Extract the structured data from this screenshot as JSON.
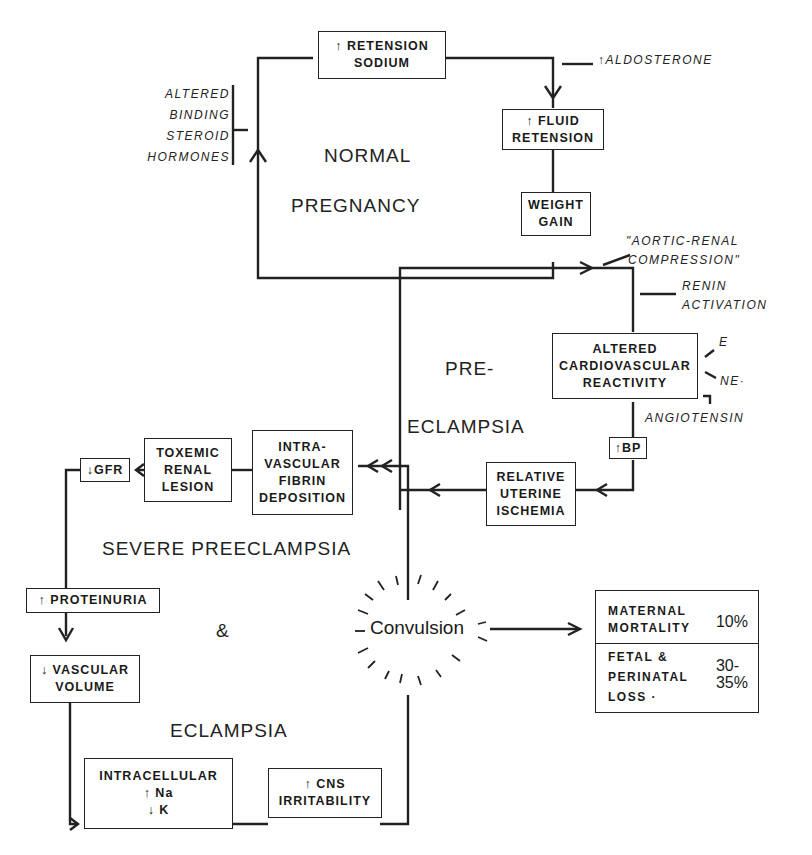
{
  "regions": {
    "normal_pregnancy": [
      "NORMAL",
      "PREGNANCY"
    ],
    "pre_eclampsia": [
      "PRE-",
      "ECLAMPSIA"
    ],
    "severe": [
      "SEVERE PREECLAMPSIA",
      "&",
      "ECLAMPSIA"
    ]
  },
  "boxes": {
    "retension_sodium": [
      "↑ RETENSION",
      "SODIUM"
    ],
    "fluid_retension": [
      "↑ FLUID",
      "RETENSION"
    ],
    "weight_gain": [
      "WEIGHT",
      "GAIN"
    ],
    "altered_cv": [
      "ALTERED",
      "CARDIOVASCULAR",
      "REACTIVITY"
    ],
    "bp": "↑BP",
    "uterine_ischemia": [
      "RELATIVE",
      "UTERINE",
      "ISCHEMIA"
    ],
    "fibrin": [
      "INTRA-",
      "VASCULAR",
      "FIBRIN",
      "DEPOSITION"
    ],
    "renal_lesion": [
      "TOXEMIC",
      "RENAL",
      "LESION"
    ],
    "gfr": "↓GFR",
    "proteinuria": "↑ PROTEINURIA",
    "vascular_volume": [
      "↓ VASCULAR",
      "VOLUME"
    ],
    "intracellular": [
      "INTRACELLULAR",
      "↑ Na",
      "↓ K"
    ],
    "cns": [
      "↑ CNS",
      "IRRITABILITY"
    ]
  },
  "notes": {
    "steroid": [
      "ALTERED",
      "BINDING",
      "STEROID",
      "HORMONES"
    ],
    "aldosterone": "↑ALDOSTERONE",
    "aortic": [
      "\"AORTIC-RENAL",
      "COMPRESSION\""
    ],
    "renin": [
      "RENIN",
      "ACTIVATION"
    ],
    "e": "E",
    "ne": "NE·",
    "angiotensin": "ANGIOTENSIN"
  },
  "convulsion": "Convulsion",
  "outcomes": {
    "maternal": {
      "label": [
        "MATERNAL",
        "MORTALITY"
      ],
      "value": "10%"
    },
    "fetal": {
      "label": [
        "FETAL &",
        "PERINATAL",
        "LOSS ·"
      ],
      "value": [
        "30-",
        "35%"
      ]
    }
  }
}
